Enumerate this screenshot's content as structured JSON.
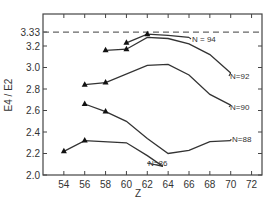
{
  "chart_data": {
    "type": "line",
    "title": "",
    "xlabel": "Z",
    "ylabel": "E4 / E2",
    "xlim": [
      52,
      73
    ],
    "ylim": [
      2.0,
      3.45
    ],
    "x_ticks": [
      54,
      56,
      58,
      60,
      62,
      64,
      66,
      68,
      70,
      72
    ],
    "y_ticks": [
      2.0,
      2.2,
      2.4,
      2.6,
      2.8,
      3.0,
      3.2,
      3.33
    ],
    "y_tick_labels": [
      "2.0",
      "2.2",
      "2.4",
      "2.6",
      "2.8",
      "3.0",
      "3.2",
      "3.33"
    ],
    "x_tick_labels": [
      "54",
      "56",
      "58",
      "60",
      "62",
      "64",
      "66",
      "68",
      "70",
      "72"
    ],
    "grid": false,
    "legend": "inline labels at curve ends",
    "reference_line": {
      "y": 3.33,
      "style": "dashed",
      "label": "3.33"
    },
    "series": [
      {
        "name": "N=94",
        "label": "N = 94",
        "points": [
          [
            60,
            3.23
          ],
          [
            62,
            3.31
          ],
          [
            64,
            3.3
          ],
          [
            66,
            3.28
          ]
        ],
        "markers": [
          [
            60,
            3.23
          ],
          [
            62,
            3.31
          ]
        ]
      },
      {
        "name": "N=92",
        "label": "N=92",
        "points": [
          [
            58,
            3.16
          ],
          [
            60,
            3.17
          ],
          [
            62,
            3.28
          ],
          [
            64,
            3.27
          ],
          [
            66,
            3.22
          ],
          [
            68,
            3.12
          ],
          [
            70,
            2.95
          ]
        ],
        "markers": [
          [
            58,
            3.16
          ],
          [
            60,
            3.17
          ]
        ]
      },
      {
        "name": "N=90",
        "label": "N=90",
        "points": [
          [
            56,
            2.84
          ],
          [
            58,
            2.86
          ],
          [
            62,
            3.02
          ],
          [
            64,
            3.03
          ],
          [
            66,
            2.93
          ],
          [
            68,
            2.75
          ],
          [
            70,
            2.65
          ]
        ],
        "markers": [
          [
            56,
            2.84
          ],
          [
            58,
            2.86
          ]
        ]
      },
      {
        "name": "N=88",
        "label": "N=88",
        "points": [
          [
            56,
            2.66
          ],
          [
            58,
            2.59
          ],
          [
            60,
            2.5
          ],
          [
            62,
            2.34
          ],
          [
            64,
            2.2
          ],
          [
            66,
            2.23
          ],
          [
            68,
            2.31
          ],
          [
            70,
            2.32
          ]
        ],
        "markers": [
          [
            56,
            2.66
          ],
          [
            58,
            2.59
          ]
        ]
      },
      {
        "name": "N=86",
        "label": "N=86",
        "points": [
          [
            54,
            2.22
          ],
          [
            56,
            2.32
          ],
          [
            60,
            2.3
          ],
          [
            62,
            2.18
          ],
          [
            63.5,
            2.08
          ]
        ],
        "markers": [
          [
            54,
            2.22
          ],
          [
            56,
            2.32
          ]
        ]
      }
    ]
  },
  "style": {
    "line_color": "#333333",
    "axis_color": "#444444",
    "dash_color": "#666666"
  }
}
